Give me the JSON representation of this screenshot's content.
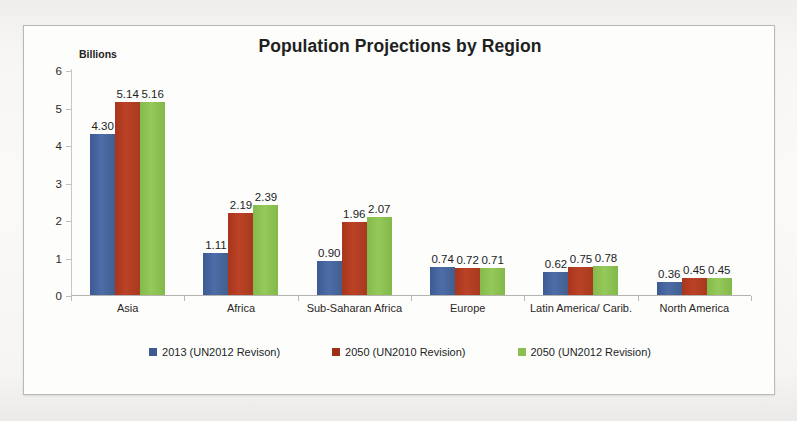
{
  "chart_data": {
    "type": "bar",
    "title": "Population Projections by Region",
    "xlabel": "",
    "ylabel": "Billions",
    "ylim": [
      0,
      6
    ],
    "yticks": [
      "0",
      "1",
      "2",
      "3",
      "4",
      "5",
      "6"
    ],
    "grid": false,
    "legend_position": "bottom",
    "categories": [
      "Asia",
      "Africa",
      "Sub-Saharan Africa",
      "Europe",
      "Latin America/ Carib.",
      "North America"
    ],
    "series": [
      {
        "name": "2013 (UN2012 Revison)",
        "color": "#3d5a93",
        "values": [
          4.3,
          1.11,
          0.9,
          0.74,
          0.62,
          0.36
        ],
        "labels": [
          "4.30",
          "1.11",
          "0.90",
          "0.74",
          "0.62",
          "0.36"
        ]
      },
      {
        "name": "2050 (UN2010 Revision)",
        "color": "#a8351c",
        "values": [
          5.14,
          2.19,
          1.96,
          0.72,
          0.75,
          0.45
        ],
        "labels": [
          "5.14",
          "2.19",
          "1.96",
          "0.72",
          "0.75",
          "0.45"
        ]
      },
      {
        "name": "2050 (UN2012 Revision)",
        "color": "#8cc152",
        "values": [
          5.16,
          2.39,
          2.07,
          0.71,
          0.78,
          0.45
        ],
        "labels": [
          "5.16",
          "2.39",
          "2.07",
          "0.71",
          "0.78",
          "0.45"
        ]
      }
    ]
  }
}
